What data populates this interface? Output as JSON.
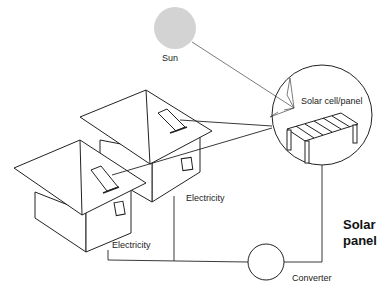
{
  "diagram": {
    "labels": {
      "sun": "Sun",
      "solar_cell": "Solar cell/panel",
      "electricity_1": "Electricity",
      "electricity_2": "Electricity",
      "converter": "Converter",
      "title_line1": "Solar",
      "title_line2": "panel"
    },
    "colors": {
      "sun": "#d3d3d3",
      "line": "#222222"
    }
  }
}
